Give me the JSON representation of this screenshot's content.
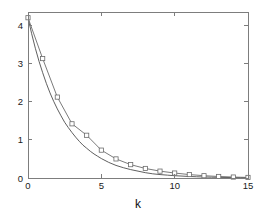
{
  "figure": {
    "background_color": "#ffffff",
    "axis_color": "#7d7d7d",
    "text_color": "#1a1a1a"
  },
  "chart_data": {
    "type": "line",
    "title": "",
    "subtitle": "",
    "xlabel": "k",
    "ylabel": "",
    "xlim": [
      0,
      15
    ],
    "ylim": [
      0,
      4.35
    ],
    "xticks": [
      0,
      5,
      10,
      15
    ],
    "xtick_labels": [
      "0",
      "5",
      "10",
      "15"
    ],
    "yticks": [
      0,
      1,
      2,
      3,
      4
    ],
    "ytick_labels": [
      "0",
      "1",
      "2",
      "3",
      "4"
    ],
    "grid": false,
    "legend": false,
    "legend_position": "none",
    "box": true,
    "x": [
      0,
      1,
      2,
      3,
      4,
      5,
      6,
      7,
      8,
      9,
      10,
      11,
      12,
      13,
      14,
      15
    ],
    "series": [
      {
        "name": "smooth-decay-curve",
        "style": "line",
        "color": "#4d4d4d",
        "marker": "none",
        "x": [
          0,
          0.25,
          0.5,
          0.75,
          1,
          1.25,
          1.5,
          1.75,
          2,
          2.25,
          2.5,
          2.75,
          3,
          3.25,
          3.5,
          3.75,
          4,
          4.25,
          4.5,
          4.75,
          5,
          5.5,
          6,
          6.5,
          7,
          7.5,
          8,
          8.5,
          9,
          9.5,
          10,
          10.5,
          11,
          11.5,
          12,
          12.5,
          13,
          13.5,
          14,
          14.5,
          15
        ],
        "values": [
          4.2,
          3.78,
          3.4,
          3.06,
          2.76,
          2.48,
          2.23,
          2.01,
          1.81,
          1.63,
          1.46,
          1.32,
          1.19,
          1.07,
          0.96,
          0.86,
          0.78,
          0.7,
          0.63,
          0.57,
          0.51,
          0.41,
          0.33,
          0.27,
          0.22,
          0.18,
          0.14,
          0.11,
          0.09,
          0.075,
          0.06,
          0.05,
          0.04,
          0.032,
          0.026,
          0.021,
          0.017,
          0.014,
          0.011,
          0.009,
          0.007
        ]
      },
      {
        "name": "marker-data-series",
        "style": "line-marker",
        "color": "#6b6b6b",
        "marker": "square",
        "marker_size": 3,
        "x": [
          0,
          1,
          2,
          3,
          4,
          5,
          6,
          7,
          8,
          9,
          10,
          11,
          12,
          13,
          14,
          15
        ],
        "values": [
          4.2,
          3.13,
          2.12,
          1.42,
          1.12,
          0.73,
          0.5,
          0.35,
          0.25,
          0.18,
          0.13,
          0.09,
          0.06,
          0.04,
          0.025,
          0.015
        ]
      }
    ],
    "annotations": []
  },
  "axes": {
    "x_axis_label": "k",
    "y_axis_label": ""
  }
}
